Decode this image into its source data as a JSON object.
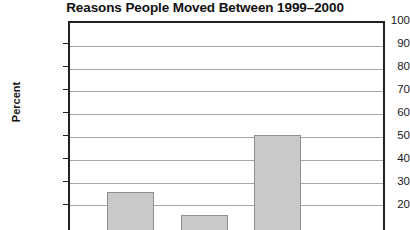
{
  "chart_data": {
    "type": "bar",
    "title": "Reasons People Moved Between 1999–2000",
    "xlabel": "",
    "ylabel": "Percent",
    "categories": [
      "bar-1",
      "bar-2",
      "bar-3"
    ],
    "values": [
      26,
      16,
      51
    ],
    "ylim": [
      0,
      100
    ],
    "yticks": [
      100,
      90,
      80,
      70,
      60,
      50,
      40,
      30,
      20
    ],
    "ytick_labels": [
      "100",
      "90",
      "80",
      "70",
      "60",
      "50",
      "40",
      "30",
      "20"
    ],
    "grid": true,
    "legend": false,
    "note": "Image is cropped at the bottom; x-axis line and category labels are not visible.",
    "colors": {
      "bar_fill": "#c9c9c9",
      "bar_border": "#8f8f8f",
      "axis": "#231f20",
      "gridline": "#a6a6a6",
      "text": "#1a1a1a",
      "background": "#ffffff"
    }
  }
}
